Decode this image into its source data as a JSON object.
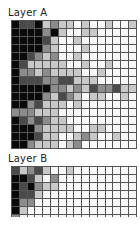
{
  "palette": {
    "K": "#0a0a0a",
    "D": "#4a4a4a",
    "M": "#8c8c8c",
    "L": "#c8c8c8",
    "W": "#f8f8f8"
  },
  "layers": [
    {
      "title": "Layer A",
      "columns": 16,
      "rows": [
        "KDDKLMLLWLWWLWWL",
        "KKKKMKLWWLLWWWWW",
        "KKKKDLWWLWWWWWWW",
        "KKKKMLWWWLWWWWWW",
        "KKDMLMWWLWWWWWWW",
        "KDLLLLLWWLWWLWWW",
        "KMMLMLLLLWWLWWWW",
        "KDDDMMDDLLLWWWWW",
        "KKKKKMMLMLDMMDLL",
        "KKKKMLDMLWLLWWLW",
        "KKMDLLLWLWWWWWWW",
        "MMMLLLWWWWWWWWWW",
        "KDMDMLLWWWWWWWWW",
        "KKKMLLLLWWLLWWWW",
        "KKKDLLWWLMLWWLWW",
        "KKMLLLWLMWWWWWWW"
      ]
    },
    {
      "title": "Layer B",
      "columns": 16,
      "rows": [
        "DLMDLWWLWWWWWWWW",
        "KKDLWMWWWWWWWWWW",
        "KDKMLLWWWWWWWWWW",
        "KDDLWWWWWWWWWWWW",
        "KMMWWWWWWWWWWWWW",
        "KLWWWWWWWWWWWWWW",
        "MWWWWWWWWWWWWWWW"
      ]
    }
  ]
}
